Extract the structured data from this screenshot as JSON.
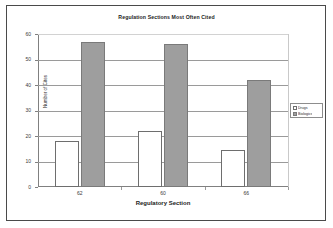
{
  "chart_data": {
    "type": "bar",
    "title": "Regulation Sections Most Often Cited",
    "xlabel": "Regulatory Section",
    "ylabel": "Number of Cites",
    "categories": [
      "62",
      "60",
      "66"
    ],
    "series": [
      {
        "name": "Drugs",
        "values": [
          18,
          22,
          14.5
        ]
      },
      {
        "name": "Biologics",
        "values": [
          57,
          56,
          42
        ]
      }
    ],
    "ylim": [
      0,
      60
    ],
    "yticks": [
      0,
      10,
      20,
      30,
      40,
      50,
      60
    ],
    "ytick_labels": [
      "0",
      "10",
      "20",
      "30",
      "40",
      "50",
      "60"
    ],
    "grid": true,
    "legend_position": "right",
    "colors": {
      "series_1_fill": "#ffffff",
      "series_1_border": "#6e6e6e",
      "series_2_fill": "#9e9e9e",
      "series_2_border": "#7a7a7a",
      "gridline": "#9a9a9a",
      "axis": "#808080",
      "frame": "#4a4a4a",
      "text": "#1d1d1d"
    }
  }
}
